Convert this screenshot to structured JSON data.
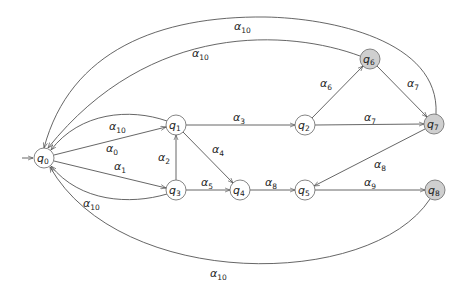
{
  "diagram": {
    "type": "automaton",
    "nodes": [
      {
        "id": "q0",
        "label": "q",
        "sub": "0",
        "x": 44,
        "y": 158,
        "accepting": false,
        "initial": true
      },
      {
        "id": "q1",
        "label": "q",
        "sub": "1",
        "x": 176,
        "y": 125,
        "accepting": false
      },
      {
        "id": "q2",
        "label": "q",
        "sub": "2",
        "x": 305,
        "y": 125,
        "accepting": false
      },
      {
        "id": "q3",
        "label": "q",
        "sub": "3",
        "x": 176,
        "y": 190,
        "accepting": false
      },
      {
        "id": "q4",
        "label": "q",
        "sub": "4",
        "x": 240,
        "y": 190,
        "accepting": false
      },
      {
        "id": "q5",
        "label": "q",
        "sub": "5",
        "x": 305,
        "y": 190,
        "accepting": false
      },
      {
        "id": "q6",
        "label": "q",
        "sub": "6",
        "x": 370,
        "y": 59,
        "accepting": true
      },
      {
        "id": "q7",
        "label": "q",
        "sub": "7",
        "x": 434,
        "y": 124,
        "accepting": true
      },
      {
        "id": "q8",
        "label": "q",
        "sub": "8",
        "x": 435,
        "y": 190,
        "accepting": true
      }
    ],
    "edges": [
      {
        "from": "q0",
        "to": "q1",
        "label": "α",
        "sub": "0"
      },
      {
        "from": "q0",
        "to": "q3",
        "label": "α",
        "sub": "1"
      },
      {
        "from": "q1",
        "to": "q0",
        "label": "α",
        "sub": "10"
      },
      {
        "from": "q3",
        "to": "q0",
        "label": "α",
        "sub": "10"
      },
      {
        "from": "q3",
        "to": "q1",
        "label": "α",
        "sub": "2"
      },
      {
        "from": "q1",
        "to": "q2",
        "label": "α",
        "sub": "3"
      },
      {
        "from": "q1",
        "to": "q4",
        "label": "α",
        "sub": "4"
      },
      {
        "from": "q3",
        "to": "q4",
        "label": "α",
        "sub": "5"
      },
      {
        "from": "q4",
        "to": "q5",
        "label": "α",
        "sub": "8"
      },
      {
        "from": "q2",
        "to": "q6",
        "label": "α",
        "sub": "6"
      },
      {
        "from": "q2",
        "to": "q7",
        "label": "α",
        "sub": "7"
      },
      {
        "from": "q6",
        "to": "q7",
        "label": "α",
        "sub": "7"
      },
      {
        "from": "q7",
        "to": "q5",
        "label": "α",
        "sub": "8"
      },
      {
        "from": "q5",
        "to": "q8",
        "label": "α",
        "sub": "9"
      },
      {
        "from": "q6",
        "to": "q0",
        "label": "α",
        "sub": "10"
      },
      {
        "from": "q7",
        "to": "q0",
        "label": "α",
        "sub": "10"
      },
      {
        "from": "q8",
        "to": "q0",
        "label": "α",
        "sub": "10"
      }
    ],
    "colors": {
      "accepting_fill": "#cfcfcf",
      "normal_fill": "#ffffff",
      "stroke": "#777777"
    }
  }
}
